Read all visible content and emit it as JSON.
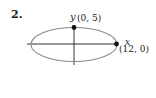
{
  "problem": {
    "number": "2."
  },
  "diagram": {
    "shape": "ellipse",
    "axes": {
      "x_label": "x",
      "y_label": "y"
    },
    "points": [
      {
        "name": "top-vertex",
        "label": "(0, 5)",
        "x": 0,
        "y": 5
      },
      {
        "name": "right-vertex",
        "label": "(12, 0)",
        "x": 12,
        "y": 0
      }
    ],
    "colors": {
      "ellipse": "#8a8a8a",
      "axes": "#333333",
      "points": "#111111"
    }
  }
}
